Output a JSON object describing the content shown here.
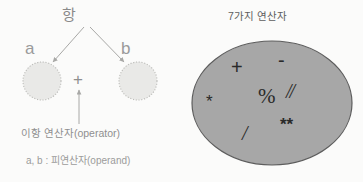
{
  "left_diagram": {
    "term_label": "항",
    "operand_a": "a",
    "operand_b": "b",
    "operator_symbol": "+",
    "operator_caption": "이항 연산자(operator)",
    "operand_caption": "a, b : 피연산자(operand)",
    "circle_fill": "#e8e8e6",
    "circle_border": "#b9b9b6",
    "arrow_color": "#a8a8a6",
    "text_color": "#8f8f8f"
  },
  "right_diagram": {
    "title": "7가지 연산자",
    "ellipse_fill": "#a7a7a7",
    "ellipse_border": "#5a5a5a",
    "operators": [
      {
        "name": "addition",
        "symbol": "+"
      },
      {
        "name": "subtraction",
        "symbol": "-"
      },
      {
        "name": "multiplication",
        "symbol": "*"
      },
      {
        "name": "modulo",
        "symbol": "%"
      },
      {
        "name": "floor-division",
        "symbol": "//"
      },
      {
        "name": "division",
        "symbol": "/"
      },
      {
        "name": "exponent",
        "symbol": "**"
      }
    ]
  },
  "page": {
    "background": "#fbfbfa"
  }
}
